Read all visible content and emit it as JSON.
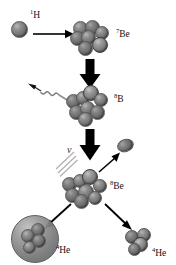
{
  "diagram": {
    "background_color": "#ffffff",
    "sphere_color": "#7b7b7b",
    "arrow_color": "#000000",
    "ray_color": "#9a9a9a"
  },
  "nodes": [
    {
      "id": "proton",
      "label_html": "1H",
      "mass_number": "1",
      "element": "H",
      "kind": "single-sphere",
      "nucleon_count": 1
    },
    {
      "id": "be7",
      "label_html": "7Be",
      "mass_number": "7",
      "element": "Be",
      "kind": "cluster",
      "nucleon_count": 7
    },
    {
      "id": "b8",
      "label_html": "8B",
      "mass_number": "8",
      "element": "B",
      "kind": "cluster",
      "nucleon_count": 8
    },
    {
      "id": "be8",
      "label_html": "8Be",
      "mass_number": "8",
      "element": "Be",
      "kind": "cluster",
      "nucleon_count": 8
    },
    {
      "id": "he4-left",
      "label_html": "4He",
      "mass_number": "4",
      "element": "He",
      "kind": "shelled-cluster",
      "nucleon_count": 4
    },
    {
      "id": "he4-right",
      "label_html": "4He",
      "mass_number": "4",
      "element": "He",
      "kind": "cluster",
      "nucleon_count": 4
    },
    {
      "id": "positron",
      "label_html": "",
      "kind": "ellipse",
      "nucleon_count": 1
    }
  ],
  "labels": {
    "hydrogen": {
      "sup": "1",
      "text": "H"
    },
    "beryllium7": {
      "sup": "7",
      "text": "Be"
    },
    "boron8": {
      "sup": "8",
      "text": "B"
    },
    "beryllium8": {
      "sup": "8",
      "text": "Be"
    },
    "helium4_left": {
      "sup": "4",
      "text": "He"
    },
    "helium4_right": {
      "sup": "4",
      "text": "He"
    },
    "neutrino": "ν"
  },
  "arrows": [
    {
      "id": "capture-arrow",
      "style": "thin",
      "direction": "right",
      "from": "proton",
      "to": "be7"
    },
    {
      "id": "gamma-arrow",
      "style": "wavy",
      "direction": "up-left",
      "from": "b8",
      "to": "gamma-ray"
    },
    {
      "id": "fusion-arrow",
      "style": "thick-block",
      "direction": "down",
      "from": "be7",
      "to": "b8"
    },
    {
      "id": "decay-arrow",
      "style": "thick-block",
      "direction": "down",
      "from": "b8",
      "to": "be8"
    },
    {
      "id": "positron-arrow",
      "style": "thin",
      "direction": "up-right",
      "from": "be8",
      "to": "positron"
    },
    {
      "id": "alpha-left-arrow",
      "style": "thin",
      "direction": "down-left",
      "from": "be8",
      "to": "he4-left"
    },
    {
      "id": "alpha-right-arrow",
      "style": "thin",
      "direction": "down-right",
      "from": "be8",
      "to": "he4-right"
    }
  ],
  "emissions": [
    {
      "id": "gamma-ray",
      "symbol": "",
      "render": "wavy-line",
      "direction": "up-left"
    },
    {
      "id": "neutrino-rays",
      "symbol": "ν",
      "render": "triple-diagonal-lines",
      "direction": "down-left"
    }
  ]
}
